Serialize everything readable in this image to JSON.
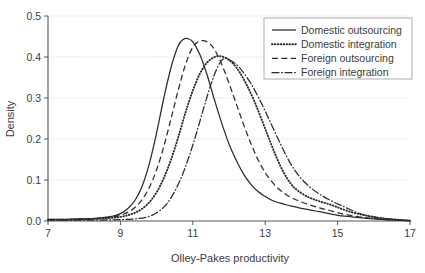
{
  "chart_data": {
    "type": "line",
    "title": "",
    "xlabel": "Olley-Pakes productivity",
    "ylabel": "Density",
    "xlim": [
      7,
      17
    ],
    "ylim": [
      0,
      0.5
    ],
    "xticks": [
      7,
      9,
      11,
      13,
      15,
      17
    ],
    "xtick_labels": [
      "7",
      "9",
      "11",
      "13",
      "15",
      "17"
    ],
    "yticks": [
      0.0,
      0.1,
      0.2,
      0.3,
      0.4,
      0.5
    ],
    "ytick_labels": [
      "0.0",
      "0.1",
      "0.2",
      "0.3",
      "0.4",
      "0.5"
    ],
    "grid": "horizontal-dotted",
    "legend_position": "top-right",
    "series": [
      {
        "name": "Domestic outsourcing",
        "style": "solid",
        "color": "#2b2b2b",
        "peak_x": 10.85,
        "peak_y": 0.445,
        "x": [
          7.0,
          7.4,
          7.8,
          8.2,
          8.5,
          8.8,
          9.0,
          9.2,
          9.4,
          9.6,
          9.8,
          10.0,
          10.2,
          10.4,
          10.6,
          10.75,
          10.85,
          11.0,
          11.2,
          11.4,
          11.6,
          11.8,
          12.0,
          12.2,
          12.4,
          12.6,
          12.8,
          13.0,
          13.2,
          13.4,
          13.6,
          13.8,
          14.0,
          14.3,
          14.6,
          15.0,
          15.3,
          15.6,
          16.0,
          16.4,
          17.0
        ],
        "y": [
          0.004,
          0.004,
          0.005,
          0.006,
          0.008,
          0.012,
          0.018,
          0.03,
          0.05,
          0.085,
          0.14,
          0.215,
          0.3,
          0.375,
          0.428,
          0.444,
          0.445,
          0.437,
          0.405,
          0.355,
          0.295,
          0.238,
          0.188,
          0.148,
          0.115,
          0.09,
          0.072,
          0.06,
          0.05,
          0.044,
          0.039,
          0.035,
          0.031,
          0.026,
          0.021,
          0.014,
          0.011,
          0.008,
          0.005,
          0.003,
          0.001
        ]
      },
      {
        "name": "Domestic integration",
        "style": "dotted",
        "color": "#2b2b2b",
        "peak_x": 11.75,
        "peak_y": 0.402,
        "x": [
          7.0,
          7.4,
          7.8,
          8.2,
          8.5,
          8.8,
          9.0,
          9.2,
          9.4,
          9.6,
          9.8,
          10.0,
          10.2,
          10.4,
          10.6,
          10.8,
          11.0,
          11.2,
          11.4,
          11.6,
          11.75,
          11.9,
          12.1,
          12.3,
          12.5,
          12.7,
          12.9,
          13.1,
          13.3,
          13.5,
          13.7,
          13.9,
          14.2,
          14.5,
          14.8,
          15.1,
          15.4,
          15.7,
          16.0,
          16.4,
          17.0
        ],
        "y": [
          0.003,
          0.003,
          0.004,
          0.005,
          0.006,
          0.008,
          0.01,
          0.014,
          0.02,
          0.03,
          0.046,
          0.07,
          0.105,
          0.15,
          0.205,
          0.265,
          0.318,
          0.36,
          0.387,
          0.4,
          0.402,
          0.398,
          0.385,
          0.362,
          0.33,
          0.292,
          0.248,
          0.202,
          0.158,
          0.12,
          0.092,
          0.074,
          0.058,
          0.048,
          0.04,
          0.03,
          0.021,
          0.015,
          0.01,
          0.005,
          0.001
        ]
      },
      {
        "name": "Foreign outsourcing",
        "style": "dashed",
        "color": "#2b2b2b",
        "peak_x": 11.3,
        "peak_y": 0.44,
        "x": [
          7.0,
          7.4,
          7.8,
          8.2,
          8.5,
          8.8,
          9.0,
          9.2,
          9.4,
          9.6,
          9.8,
          10.0,
          10.2,
          10.4,
          10.6,
          10.8,
          11.0,
          11.15,
          11.3,
          11.45,
          11.6,
          11.8,
          12.0,
          12.2,
          12.4,
          12.6,
          12.8,
          13.0,
          13.2,
          13.4,
          13.6,
          13.9,
          14.2,
          14.5,
          14.8,
          15.1,
          15.4,
          15.7,
          16.0,
          16.4,
          17.0
        ],
        "y": [
          0.003,
          0.003,
          0.004,
          0.005,
          0.007,
          0.01,
          0.014,
          0.021,
          0.033,
          0.052,
          0.082,
          0.125,
          0.182,
          0.25,
          0.32,
          0.382,
          0.424,
          0.437,
          0.44,
          0.434,
          0.418,
          0.382,
          0.336,
          0.286,
          0.236,
          0.19,
          0.15,
          0.118,
          0.094,
          0.076,
          0.063,
          0.05,
          0.04,
          0.032,
          0.025,
          0.018,
          0.013,
          0.009,
          0.006,
          0.003,
          0.001
        ]
      },
      {
        "name": "Foreign integration",
        "style": "dashdot",
        "color": "#2b2b2b",
        "peak_x": 11.85,
        "peak_y": 0.396,
        "x": [
          7.0,
          7.6,
          8.2,
          8.8,
          9.2,
          9.5,
          9.7,
          9.9,
          10.1,
          10.3,
          10.5,
          10.7,
          10.9,
          11.1,
          11.3,
          11.5,
          11.7,
          11.85,
          12.0,
          12.2,
          12.4,
          12.6,
          12.8,
          13.0,
          13.2,
          13.4,
          13.6,
          13.8,
          14.0,
          14.3,
          14.6,
          14.9,
          15.2,
          15.5,
          15.8,
          16.1,
          16.5,
          17.0
        ],
        "y": [
          0.002,
          0.002,
          0.002,
          0.003,
          0.004,
          0.006,
          0.009,
          0.015,
          0.026,
          0.044,
          0.072,
          0.11,
          0.158,
          0.214,
          0.275,
          0.333,
          0.378,
          0.396,
          0.394,
          0.382,
          0.362,
          0.336,
          0.304,
          0.268,
          0.23,
          0.192,
          0.156,
          0.126,
          0.103,
          0.078,
          0.06,
          0.046,
          0.034,
          0.022,
          0.013,
          0.008,
          0.004,
          0.001
        ]
      }
    ]
  },
  "legend": {
    "items": [
      {
        "label": "Domestic outsourcing"
      },
      {
        "label": "Domestic integration"
      },
      {
        "label": "Foreign outsourcing"
      },
      {
        "label": "Foreign integration"
      }
    ]
  }
}
